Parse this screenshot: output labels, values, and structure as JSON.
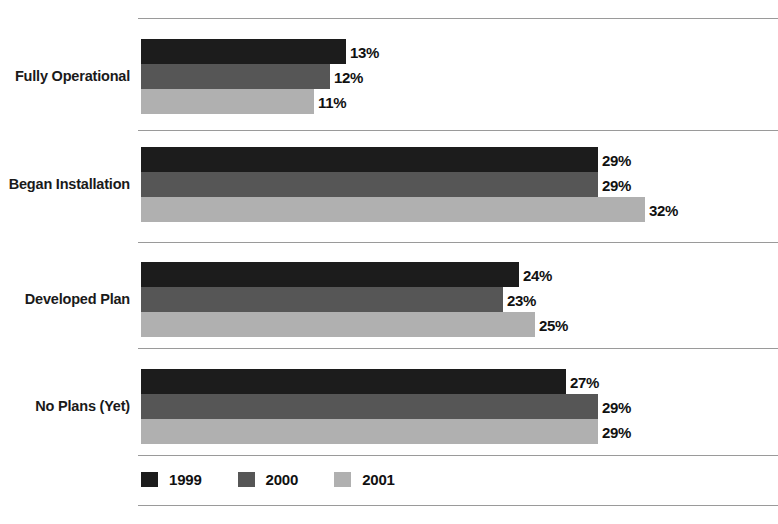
{
  "chart_data": {
    "type": "bar",
    "orientation": "horizontal",
    "title": "",
    "xlabel": "",
    "ylabel": "",
    "grid": false,
    "legend_position": "bottom-left",
    "xlim": [
      0,
      40
    ],
    "value_suffix": "%",
    "categories": [
      "Fully Operational",
      "Began Installation",
      "Developed Plan",
      "No Plans (Yet)"
    ],
    "series": [
      {
        "name": "1999",
        "color": "#1c1c1c",
        "values": [
          13,
          29,
          24,
          27
        ]
      },
      {
        "name": "2000",
        "color": "#565656",
        "values": [
          12,
          29,
          23,
          29
        ]
      },
      {
        "name": "2001",
        "color": "#b0b0b0",
        "values": [
          11,
          32,
          25,
          29
        ]
      }
    ],
    "value_labels": [
      [
        "13%",
        "12%",
        "11%"
      ],
      [
        "29%",
        "29%",
        "32%"
      ],
      [
        "24%",
        "23%",
        "25%"
      ],
      [
        "27%",
        "29%",
        "29%"
      ]
    ]
  },
  "legend": {
    "items": [
      {
        "label": "1999",
        "swatch": "s1999"
      },
      {
        "label": "2000",
        "swatch": "s2000"
      },
      {
        "label": "2001",
        "swatch": "s2001"
      }
    ]
  },
  "artifacts": {
    "title_remnant": ""
  }
}
